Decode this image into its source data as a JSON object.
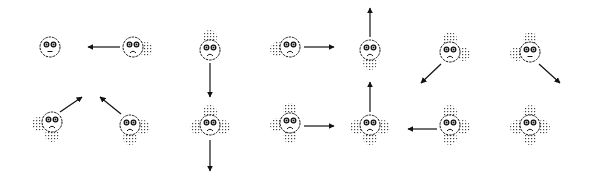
{
  "diagram": {
    "colors": {
      "ink": "#111111",
      "stipple": "#555555",
      "background": "#ffffff"
    },
    "faces": [
      {
        "id": "r1c1",
        "cx": 50,
        "cy": 47,
        "mood": "neutral",
        "stipple": [],
        "arrow": null
      },
      {
        "id": "r1c2",
        "cx": 133,
        "cy": 47,
        "mood": "sad",
        "stipple": [
          "right"
        ],
        "arrow": "left"
      },
      {
        "id": "r1c3",
        "cx": 210,
        "cy": 50,
        "mood": "sad",
        "stipple": [
          "top"
        ],
        "arrow": "down"
      },
      {
        "id": "r1c4",
        "cx": 290,
        "cy": 47,
        "mood": "sad",
        "stipple": [
          "left"
        ],
        "arrow": "right"
      },
      {
        "id": "r1c5",
        "cx": 370,
        "cy": 50,
        "mood": "sad",
        "stipple": [
          "bottom"
        ],
        "arrow": "up"
      },
      {
        "id": "r1c6",
        "cx": 450,
        "cy": 52,
        "mood": "sad",
        "stipple": [
          "top",
          "right"
        ],
        "arrow": "down-left"
      },
      {
        "id": "r1c7",
        "cx": 530,
        "cy": 52,
        "mood": "neutral",
        "stipple": [
          "top",
          "left"
        ],
        "arrow": "down-right"
      },
      {
        "id": "r2c1",
        "cx": 52,
        "cy": 122,
        "mood": "sad",
        "stipple": [
          "left",
          "bottom"
        ],
        "arrow": "up-right"
      },
      {
        "id": "r2c2",
        "cx": 130,
        "cy": 125,
        "mood": "sad",
        "stipple": [
          "right",
          "bottom"
        ],
        "arrow": "up-left"
      },
      {
        "id": "r2c3",
        "cx": 210,
        "cy": 125,
        "mood": "sad",
        "stipple": [
          "top",
          "left",
          "right"
        ],
        "arrow": "down"
      },
      {
        "id": "r2c4",
        "cx": 290,
        "cy": 123,
        "mood": "sad",
        "stipple": [
          "top",
          "left",
          "bottom"
        ],
        "arrow": "right"
      },
      {
        "id": "r2c5",
        "cx": 370,
        "cy": 125,
        "mood": "sad",
        "stipple": [
          "left",
          "right",
          "bottom"
        ],
        "arrow": "up"
      },
      {
        "id": "r2c6",
        "cx": 450,
        "cy": 125,
        "mood": "sad",
        "stipple": [
          "top",
          "right",
          "bottom"
        ],
        "arrow": "left"
      },
      {
        "id": "r2c7",
        "cx": 530,
        "cy": 125,
        "mood": "sad",
        "stipple": [
          "top",
          "left",
          "right",
          "bottom"
        ],
        "arrow": null
      }
    ],
    "arrows": [
      {
        "from": "r1c2",
        "x1": 120,
        "y1": 47,
        "x2": 88,
        "y2": 47
      },
      {
        "from": "r1c3",
        "x1": 210,
        "y1": 63,
        "x2": 210,
        "y2": 97
      },
      {
        "from": "r1c4",
        "x1": 304,
        "y1": 47,
        "x2": 334,
        "y2": 47
      },
      {
        "from": "r1c5",
        "x1": 370,
        "y1": 37,
        "x2": 370,
        "y2": 8
      },
      {
        "from": "r1c6",
        "x1": 441,
        "y1": 64,
        "x2": 421,
        "y2": 83
      },
      {
        "from": "r1c7",
        "x1": 539,
        "y1": 64,
        "x2": 560,
        "y2": 83
      },
      {
        "from": "r2c1",
        "x1": 60,
        "y1": 112,
        "x2": 82,
        "y2": 97
      },
      {
        "from": "r2c2",
        "x1": 121,
        "y1": 114,
        "x2": 100,
        "y2": 97
      },
      {
        "from": "r2c3",
        "x1": 210,
        "y1": 140,
        "x2": 210,
        "y2": 171
      },
      {
        "from": "r2c4",
        "x1": 304,
        "y1": 126,
        "x2": 334,
        "y2": 126
      },
      {
        "from": "r2c5",
        "x1": 370,
        "y1": 112,
        "x2": 370,
        "y2": 82
      },
      {
        "from": "r2c6",
        "x1": 437,
        "y1": 129,
        "x2": 408,
        "y2": 129
      }
    ]
  }
}
